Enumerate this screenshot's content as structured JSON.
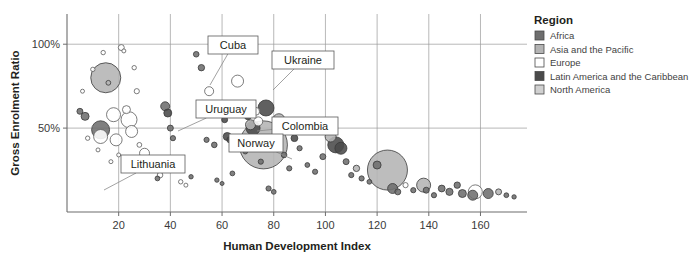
{
  "chart_data": {
    "type": "scatter",
    "title": "",
    "xlabel": "Human Development Index",
    "ylabel": "Gross Enrolment Ratio",
    "xlim": [
      0,
      178
    ],
    "ylim": [
      0,
      118
    ],
    "xticks": [
      20,
      40,
      60,
      80,
      100,
      120,
      140,
      160
    ],
    "xtick_labels": [
      "20",
      "40",
      "60",
      "80",
      "100",
      "120",
      "140",
      "160"
    ],
    "yticks": [
      50,
      100
    ],
    "ytick_labels": [
      "50%",
      "100%"
    ],
    "grid": "both",
    "legend_position": "right",
    "size_encoding": "bubble area = population",
    "series": [
      {
        "name": "Africa",
        "color": "#6e6e6e"
      },
      {
        "name": "Asia and the Pacific",
        "color": "#b4b4b4"
      },
      {
        "name": "Europe",
        "color": "#ffffff"
      },
      {
        "name": "Latin America and the Caribbean",
        "color": "#4a4a4a"
      },
      {
        "name": "North America",
        "color": "#d0d0d0"
      }
    ],
    "points": [
      {
        "x": 5,
        "y": 60,
        "r": 3.0,
        "region": "Africa"
      },
      {
        "x": 6,
        "y": 72,
        "r": 2.0,
        "region": "Europe"
      },
      {
        "x": 7,
        "y": 57,
        "r": 4.0,
        "region": "Africa"
      },
      {
        "x": 8,
        "y": 44,
        "r": 2.2,
        "region": "Europe"
      },
      {
        "x": 10,
        "y": 85,
        "r": 2.2,
        "region": "Europe"
      },
      {
        "x": 12,
        "y": 37,
        "r": 2.0,
        "region": "Europe"
      },
      {
        "x": 13,
        "y": 49,
        "r": 9.0,
        "region": "Africa"
      },
      {
        "x": 13,
        "y": 45,
        "r": 7.0,
        "region": "Europe"
      },
      {
        "x": 14,
        "y": 95,
        "r": 2.2,
        "region": "Europe"
      },
      {
        "x": 15,
        "y": 80,
        "r": 15.0,
        "region": "Asia and the Pacific"
      },
      {
        "x": 16,
        "y": 77,
        "r": 2.4,
        "region": "Asia and the Pacific"
      },
      {
        "x": 17,
        "y": 30,
        "r": 2.0,
        "region": "Europe"
      },
      {
        "x": 18,
        "y": 58,
        "r": 7.0,
        "region": "Europe"
      },
      {
        "x": 19,
        "y": 43,
        "r": 6.0,
        "region": "Europe"
      },
      {
        "x": 20,
        "y": 34,
        "r": 2.0,
        "region": "Europe"
      },
      {
        "x": 21,
        "y": 98,
        "r": 3.0,
        "region": "Europe"
      },
      {
        "x": 22,
        "y": 96,
        "r": 2.0,
        "region": "Europe"
      },
      {
        "x": 23,
        "y": 61,
        "r": 4.0,
        "region": "Europe"
      },
      {
        "x": 24,
        "y": 55,
        "r": 8.0,
        "region": "Europe"
      },
      {
        "x": 25,
        "y": 48,
        "r": 6.0,
        "region": "Europe"
      },
      {
        "x": 26,
        "y": 86,
        "r": 2.2,
        "region": "Europe"
      },
      {
        "x": 27,
        "y": 72,
        "r": 2.6,
        "region": "Europe"
      },
      {
        "x": 28,
        "y": 40,
        "r": 2.4,
        "region": "Europe"
      },
      {
        "x": 29,
        "y": 28,
        "r": 2.0,
        "region": "Europe"
      },
      {
        "x": 30,
        "y": 35,
        "r": 5.0,
        "region": "Europe"
      },
      {
        "x": 31,
        "y": 25,
        "r": 2.0,
        "region": "Europe"
      },
      {
        "x": 33,
        "y": 30,
        "r": 2.2,
        "region": "Europe"
      },
      {
        "x": 35,
        "y": 20,
        "r": 2.4,
        "region": "Africa"
      },
      {
        "x": 36,
        "y": 22,
        "r": 2.8,
        "region": "Europe"
      },
      {
        "x": 38,
        "y": 63,
        "r": 4.5,
        "region": "Africa"
      },
      {
        "x": 39,
        "y": 59,
        "r": 4.0,
        "region": "Latin America and the Caribbean"
      },
      {
        "x": 40,
        "y": 50,
        "r": 3.0,
        "region": "Africa"
      },
      {
        "x": 41,
        "y": 44,
        "r": 2.6,
        "region": "Africa"
      },
      {
        "x": 42,
        "y": 32,
        "r": 2.4,
        "region": "Africa"
      },
      {
        "x": 43,
        "y": 26,
        "r": 2.2,
        "region": "Africa"
      },
      {
        "x": 44,
        "y": 18,
        "r": 2.2,
        "region": "Europe"
      },
      {
        "x": 46,
        "y": 16,
        "r": 2.0,
        "region": "Europe"
      },
      {
        "x": 48,
        "y": 21,
        "r": 2.2,
        "region": "Africa"
      },
      {
        "x": 50,
        "y": 94,
        "r": 2.8,
        "region": "Africa"
      },
      {
        "x": 52,
        "y": 86,
        "r": 3.2,
        "region": "Africa"
      },
      {
        "x": 54,
        "y": 43,
        "r": 2.6,
        "region": "Africa"
      },
      {
        "x": 55,
        "y": 72,
        "r": 4.5,
        "region": "Europe"
      },
      {
        "x": 57,
        "y": 40,
        "r": 2.8,
        "region": "Africa"
      },
      {
        "x": 58,
        "y": 19,
        "r": 2.2,
        "region": "Africa"
      },
      {
        "x": 60,
        "y": 17,
        "r": 2.0,
        "region": "Africa"
      },
      {
        "x": 61,
        "y": 55,
        "r": 3.0,
        "region": "Latin America and the Caribbean"
      },
      {
        "x": 62,
        "y": 45,
        "r": 4.0,
        "region": "Latin America and the Caribbean"
      },
      {
        "x": 63,
        "y": 43,
        "r": 3.0,
        "region": "Latin America and the Caribbean"
      },
      {
        "x": 64,
        "y": 23,
        "r": 2.4,
        "region": "Africa"
      },
      {
        "x": 66,
        "y": 78,
        "r": 6.0,
        "region": "Europe"
      },
      {
        "x": 67,
        "y": 42,
        "r": 2.8,
        "region": "Africa"
      },
      {
        "x": 69,
        "y": 36,
        "r": 2.4,
        "region": "Africa"
      },
      {
        "x": 70,
        "y": 57,
        "r": 3.4,
        "region": "Latin America and the Caribbean"
      },
      {
        "x": 71,
        "y": 52,
        "r": 5.0,
        "region": "Asia and the Pacific"
      },
      {
        "x": 72,
        "y": 50,
        "r": 7.0,
        "region": "Latin America and the Caribbean"
      },
      {
        "x": 73,
        "y": 60,
        "r": 4.0,
        "region": "Europe"
      },
      {
        "x": 74,
        "y": 54,
        "r": 4.5,
        "region": "Europe"
      },
      {
        "x": 75,
        "y": 30,
        "r": 2.6,
        "region": "Africa"
      },
      {
        "x": 76,
        "y": 40,
        "r": 24.0,
        "region": "Asia and the Pacific"
      },
      {
        "x": 77,
        "y": 62,
        "r": 8.0,
        "region": "Latin America and the Caribbean"
      },
      {
        "x": 78,
        "y": 14,
        "r": 2.6,
        "region": "Africa"
      },
      {
        "x": 80,
        "y": 12,
        "r": 2.4,
        "region": "Africa"
      },
      {
        "x": 82,
        "y": 55,
        "r": 6.0,
        "region": "Asia and the Pacific"
      },
      {
        "x": 84,
        "y": 34,
        "r": 2.8,
        "region": "Africa"
      },
      {
        "x": 86,
        "y": 26,
        "r": 2.6,
        "region": "Africa"
      },
      {
        "x": 88,
        "y": 44,
        "r": 3.4,
        "region": "Latin America and the Caribbean"
      },
      {
        "x": 90,
        "y": 38,
        "r": 2.6,
        "region": "Africa"
      },
      {
        "x": 93,
        "y": 28,
        "r": 2.4,
        "region": "Africa"
      },
      {
        "x": 96,
        "y": 24,
        "r": 2.6,
        "region": "Africa"
      },
      {
        "x": 99,
        "y": 33,
        "r": 3.0,
        "region": "Africa"
      },
      {
        "x": 102,
        "y": 45,
        "r": 5.5,
        "region": "Asia and the Pacific"
      },
      {
        "x": 104,
        "y": 40,
        "r": 8.0,
        "region": "Latin America and the Caribbean"
      },
      {
        "x": 106,
        "y": 38,
        "r": 6.0,
        "region": "Latin America and the Caribbean"
      },
      {
        "x": 108,
        "y": 30,
        "r": 3.0,
        "region": "Africa"
      },
      {
        "x": 110,
        "y": 22,
        "r": 2.6,
        "region": "Africa"
      },
      {
        "x": 112,
        "y": 26,
        "r": 3.2,
        "region": "Asia and the Pacific"
      },
      {
        "x": 114,
        "y": 20,
        "r": 2.6,
        "region": "Africa"
      },
      {
        "x": 117,
        "y": 18,
        "r": 2.4,
        "region": "Africa"
      },
      {
        "x": 120,
        "y": 28,
        "r": 4.0,
        "region": "Africa"
      },
      {
        "x": 124,
        "y": 25,
        "r": 20.0,
        "region": "Asia and the Pacific"
      },
      {
        "x": 126,
        "y": 14,
        "r": 5.0,
        "region": "Africa"
      },
      {
        "x": 128,
        "y": 12,
        "r": 3.0,
        "region": "Africa"
      },
      {
        "x": 131,
        "y": 16,
        "r": 2.6,
        "region": "Europe"
      },
      {
        "x": 134,
        "y": 13,
        "r": 2.6,
        "region": "Africa"
      },
      {
        "x": 138,
        "y": 16,
        "r": 7.0,
        "region": "Asia and the Pacific"
      },
      {
        "x": 139,
        "y": 13,
        "r": 3.0,
        "region": "Africa"
      },
      {
        "x": 142,
        "y": 10,
        "r": 2.6,
        "region": "Africa"
      },
      {
        "x": 145,
        "y": 14,
        "r": 3.4,
        "region": "Africa"
      },
      {
        "x": 148,
        "y": 12,
        "r": 3.6,
        "region": "Africa"
      },
      {
        "x": 151,
        "y": 16,
        "r": 3.2,
        "region": "Africa"
      },
      {
        "x": 153,
        "y": 11,
        "r": 4.0,
        "region": "Africa"
      },
      {
        "x": 157,
        "y": 10,
        "r": 5.0,
        "region": "Africa"
      },
      {
        "x": 158,
        "y": 12,
        "r": 7.0,
        "region": "Europe"
      },
      {
        "x": 163,
        "y": 11,
        "r": 5.0,
        "region": "Africa"
      },
      {
        "x": 167,
        "y": 12,
        "r": 3.0,
        "region": "Asia and the Pacific"
      },
      {
        "x": 170,
        "y": 10,
        "r": 2.4,
        "region": "Africa"
      },
      {
        "x": 173,
        "y": 9,
        "r": 2.2,
        "region": "Africa"
      }
    ],
    "annotations": [
      {
        "label": "Cuba",
        "box": [
          208,
          36,
          50,
          18
        ],
        "anchor": [
          210,
          85
        ]
      },
      {
        "label": "Ukraine",
        "box": [
          272,
          51,
          62,
          18
        ],
        "anchor": [
          273,
          90
        ]
      },
      {
        "label": "Uruguay",
        "box": [
          196,
          100,
          60,
          18
        ],
        "anchor": [
          178,
          131
        ]
      },
      {
        "label": "Colombia",
        "box": [
          272,
          117,
          66,
          18
        ],
        "anchor": [
          257,
          131
        ]
      },
      {
        "label": "Norway",
        "box": [
          229,
          134,
          54,
          18
        ],
        "anchor": [
          292,
          159
        ]
      },
      {
        "label": "Lithuania",
        "box": [
          121,
          155,
          64,
          18
        ],
        "anchor": [
          104,
          190
        ]
      }
    ]
  },
  "legend": {
    "title": "Region",
    "items": [
      {
        "label": "Africa",
        "color": "#6e6e6e"
      },
      {
        "label": "Asia and the Pacific",
        "color": "#b4b4b4"
      },
      {
        "label": "Europe",
        "color": "#ffffff"
      },
      {
        "label": "Latin America and the Caribbean",
        "color": "#4a4a4a"
      },
      {
        "label": "North America",
        "color": "#d0d0d0"
      }
    ]
  }
}
